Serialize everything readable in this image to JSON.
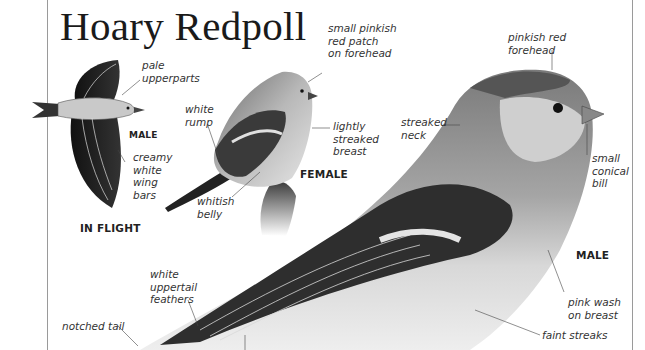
{
  "page": {
    "title": "Hoary Redpoll"
  },
  "figures": {
    "in_flight": {
      "caption": "IN FLIGHT",
      "sex_label": "MALE",
      "annotations": [
        "pale\nupperparts",
        "creamy\nwhite\nwing\nbars"
      ]
    },
    "female": {
      "caption": "FEMALE",
      "annotations": [
        "small pinkish\nred patch\non forehead",
        "white\nrump",
        "lightly\nstreaked\nbreast",
        "whitish\nbelly"
      ]
    },
    "male": {
      "caption": "MALE",
      "annotations": [
        "pinkish red\nforehead",
        "streaked\nneck",
        "small\nconical\nbill",
        "pink wash\non breast",
        "white\nuppertail\nfeathers",
        "notched tail",
        "faint streaks"
      ]
    }
  }
}
